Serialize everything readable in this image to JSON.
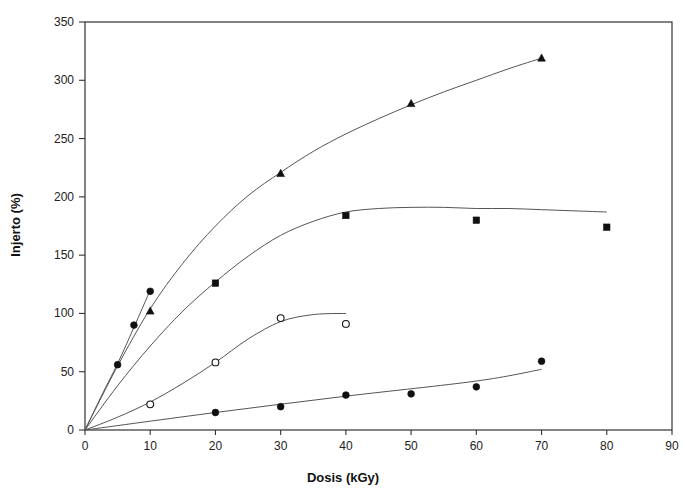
{
  "figure": {
    "name": "injerto-vs-dosis-scatter",
    "background_color": "#ffffff",
    "axis_color": "#333333",
    "marker_color": "#101010",
    "curve_color": "#555555"
  },
  "chart_data": {
    "type": "scatter",
    "title": "",
    "subtitle": "",
    "xlabel": "Dosis (kGy)",
    "ylabel": "Injerto (%)",
    "xlim": [
      0,
      90
    ],
    "ylim": [
      0,
      350
    ],
    "xticks": [
      0,
      10,
      20,
      30,
      40,
      50,
      60,
      70,
      80,
      90
    ],
    "yticks": [
      0,
      50,
      100,
      150,
      200,
      250,
      300,
      350
    ],
    "xtick_labels": [
      "0",
      "10",
      "20",
      "30",
      "40",
      "50",
      "60",
      "70",
      "80",
      "90"
    ],
    "ytick_labels": [
      "0",
      "50",
      "100",
      "150",
      "200",
      "250",
      "300",
      "350"
    ],
    "grid": false,
    "legend": "none",
    "legend_position": "none",
    "annotations": [],
    "series": [
      {
        "name": "Series 1 - steep filled circles",
        "marker": "filled-circle",
        "points": [
          {
            "x": 0,
            "y": 0
          },
          {
            "x": 5,
            "y": 56
          },
          {
            "x": 7.5,
            "y": 90
          },
          {
            "x": 10,
            "y": 119
          }
        ],
        "fit_curve": [
          {
            "x": 0,
            "y": 0
          },
          {
            "x": 2.5,
            "y": 29
          },
          {
            "x": 5,
            "y": 57
          },
          {
            "x": 7.5,
            "y": 88
          },
          {
            "x": 10,
            "y": 120
          }
        ]
      },
      {
        "name": "Series 2 - filled triangles",
        "marker": "filled-triangle",
        "points": [
          {
            "x": 0,
            "y": 0
          },
          {
            "x": 10,
            "y": 102
          },
          {
            "x": 30,
            "y": 220
          },
          {
            "x": 50,
            "y": 280
          },
          {
            "x": 70,
            "y": 319
          }
        ],
        "fit_curve": [
          {
            "x": 0,
            "y": 0
          },
          {
            "x": 5,
            "y": 55
          },
          {
            "x": 10,
            "y": 104
          },
          {
            "x": 15,
            "y": 143
          },
          {
            "x": 20,
            "y": 175
          },
          {
            "x": 25,
            "y": 201
          },
          {
            "x": 30,
            "y": 221
          },
          {
            "x": 35,
            "y": 239
          },
          {
            "x": 40,
            "y": 254
          },
          {
            "x": 45,
            "y": 267
          },
          {
            "x": 50,
            "y": 279
          },
          {
            "x": 55,
            "y": 290
          },
          {
            "x": 60,
            "y": 300
          },
          {
            "x": 65,
            "y": 310
          },
          {
            "x": 70,
            "y": 319
          }
        ]
      },
      {
        "name": "Series 3 - filled squares",
        "marker": "filled-square",
        "points": [
          {
            "x": 0,
            "y": 0
          },
          {
            "x": 20,
            "y": 126
          },
          {
            "x": 40,
            "y": 184
          },
          {
            "x": 60,
            "y": 180
          },
          {
            "x": 80,
            "y": 174
          }
        ],
        "fit_curve": [
          {
            "x": 0,
            "y": 0
          },
          {
            "x": 5,
            "y": 38
          },
          {
            "x": 10,
            "y": 72
          },
          {
            "x": 15,
            "y": 102
          },
          {
            "x": 20,
            "y": 127
          },
          {
            "x": 25,
            "y": 149
          },
          {
            "x": 30,
            "y": 167
          },
          {
            "x": 35,
            "y": 179
          },
          {
            "x": 40,
            "y": 187
          },
          {
            "x": 45,
            "y": 190
          },
          {
            "x": 50,
            "y": 191
          },
          {
            "x": 55,
            "y": 191
          },
          {
            "x": 60,
            "y": 190
          },
          {
            "x": 65,
            "y": 190
          },
          {
            "x": 70,
            "y": 189
          },
          {
            "x": 75,
            "y": 188
          },
          {
            "x": 80,
            "y": 187
          }
        ]
      },
      {
        "name": "Series 4 - open circles",
        "marker": "open-circle",
        "points": [
          {
            "x": 0,
            "y": 0
          },
          {
            "x": 10,
            "y": 22
          },
          {
            "x": 20,
            "y": 58
          },
          {
            "x": 30,
            "y": 96
          },
          {
            "x": 40,
            "y": 91
          }
        ],
        "fit_curve": [
          {
            "x": 0,
            "y": 0
          },
          {
            "x": 5,
            "y": 11
          },
          {
            "x": 10,
            "y": 24
          },
          {
            "x": 15,
            "y": 40
          },
          {
            "x": 20,
            "y": 58
          },
          {
            "x": 25,
            "y": 78
          },
          {
            "x": 30,
            "y": 93
          },
          {
            "x": 35,
            "y": 99
          },
          {
            "x": 40,
            "y": 100
          }
        ]
      },
      {
        "name": "Series 5 - lower filled circles",
        "marker": "filled-circle",
        "points": [
          {
            "x": 0,
            "y": 0
          },
          {
            "x": 20,
            "y": 15
          },
          {
            "x": 30,
            "y": 20
          },
          {
            "x": 40,
            "y": 30
          },
          {
            "x": 50,
            "y": 31
          },
          {
            "x": 60,
            "y": 37
          },
          {
            "x": 70,
            "y": 59
          }
        ],
        "fit_curve": [
          {
            "x": 0,
            "y": 0
          },
          {
            "x": 20,
            "y": 15
          },
          {
            "x": 40,
            "y": 29
          },
          {
            "x": 60,
            "y": 42
          },
          {
            "x": 70,
            "y": 52
          }
        ]
      }
    ]
  }
}
